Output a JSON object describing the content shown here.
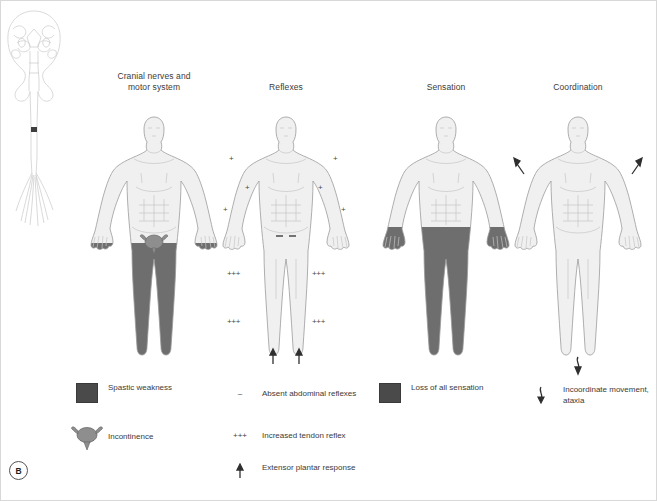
{
  "figure": {
    "panel_letter": "B",
    "background_color": "#ffffff",
    "shade_color": "#6e6e6e",
    "swatch_color": "#4a4a4a",
    "outline_color": "#9a9a9a",
    "body_fill": "#f0f0f0",
    "text_color": "#3b3b3b"
  },
  "cns_diagram": {
    "name": "brain-and-spinal-cord",
    "lesion_marker_color": "#3d3d3d"
  },
  "columns": [
    {
      "id": "cranial-motor",
      "title": "Cranial nerves and\nmotor system",
      "shading": "legs",
      "markers": []
    },
    {
      "id": "reflexes",
      "title": "Reflexes",
      "shading": "none",
      "markers": [
        {
          "symbol": "+",
          "label": "biceps-reflex-left",
          "x": 8,
          "y": 46
        },
        {
          "symbol": "+",
          "label": "biceps-reflex-right",
          "x": 112,
          "y": 46
        },
        {
          "symbol": "+",
          "label": "triceps-reflex-left",
          "x": 24,
          "y": 75
        },
        {
          "symbol": "+",
          "label": "triceps-reflex-right",
          "x": 97,
          "y": 75
        },
        {
          "symbol": "+",
          "label": "supinator-reflex-left",
          "x": 2,
          "y": 97
        },
        {
          "symbol": "+",
          "label": "supinator-reflex-right",
          "x": 120,
          "y": 97
        },
        {
          "symbol": "+++",
          "label": "knee-reflex-left",
          "x": 6,
          "y": 177
        },
        {
          "symbol": "+++",
          "label": "knee-reflex-right",
          "x": 98,
          "y": 177
        },
        {
          "symbol": "+++",
          "label": "ankle-reflex-left",
          "x": 6,
          "y": 228
        },
        {
          "symbol": "+++",
          "label": "ankle-reflex-right",
          "x": 98,
          "y": 228
        }
      ],
      "abdominal_absent_marks": 2,
      "plantar_arrows": 2
    },
    {
      "id": "sensation",
      "title": "Sensation",
      "shading": "waist-down",
      "markers": []
    },
    {
      "id": "coordination",
      "title": "Coordination",
      "shading": "none",
      "markers": [],
      "ataxia_arrows": [
        "upper-left",
        "upper-right",
        "lower-wavy"
      ]
    }
  ],
  "legend": [
    {
      "id": "spastic-weakness",
      "type": "swatch",
      "symbol": "",
      "label": "Spastic weakness",
      "x": 75,
      "y": 382
    },
    {
      "id": "absent-abdominal-reflexes",
      "type": "symbol",
      "symbol": "–",
      "label": "Absent abdominal reflexes",
      "x": 225,
      "y": 388
    },
    {
      "id": "loss-of-all-sensation",
      "type": "swatch",
      "symbol": "",
      "label": "Loss of all sensation",
      "x": 378,
      "y": 382
    },
    {
      "id": "incoordinate-movement",
      "type": "wavy-arrow",
      "symbol": "",
      "label": "Incoordinate movement,\nataxia",
      "x": 526,
      "y": 384
    },
    {
      "id": "incontinence",
      "type": "bladder",
      "symbol": "",
      "label": "Incontinence",
      "x": 75,
      "y": 424
    },
    {
      "id": "increased-tendon-reflex",
      "type": "symbol",
      "symbol": "+++",
      "label": "Increased tendon reflex",
      "x": 225,
      "y": 430
    },
    {
      "id": "extensor-plantar-response",
      "type": "up-arrow",
      "symbol": "",
      "label": "Extensor plantar response",
      "x": 225,
      "y": 462
    }
  ]
}
